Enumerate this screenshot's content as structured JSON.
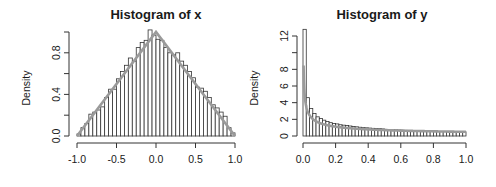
{
  "chart_data": [
    {
      "type": "bar",
      "title": "Histogram of x",
      "xlabel": "",
      "ylabel": "Density",
      "xlim": [
        -1.0,
        1.0
      ],
      "ylim": [
        0,
        1.0
      ],
      "x_ticks": [
        "-1.0",
        "-0.5",
        "0.0",
        "0.5",
        "1.0"
      ],
      "y_ticks": [
        "0.0",
        "0.4",
        "0.8"
      ],
      "y_minor_ticks": [
        0.0,
        0.2,
        0.4,
        0.6,
        0.8,
        1.0
      ],
      "bin_width": 0.05,
      "bin_start": -1.0,
      "values": [
        0.02,
        0.08,
        0.12,
        0.21,
        0.23,
        0.25,
        0.28,
        0.37,
        0.45,
        0.45,
        0.55,
        0.62,
        0.68,
        0.75,
        0.72,
        0.85,
        0.9,
        0.92,
        1.02,
        0.97,
        0.93,
        0.92,
        0.85,
        0.8,
        0.78,
        0.8,
        0.72,
        0.68,
        0.62,
        0.56,
        0.47,
        0.46,
        0.43,
        0.37,
        0.3,
        0.27,
        0.23,
        0.19,
        0.08,
        0.03
      ],
      "overlay": {
        "type": "line",
        "name": "density curve",
        "shape": "triangular",
        "points": [
          [
            -1.0,
            0.0
          ],
          [
            0.0,
            1.0
          ],
          [
            1.0,
            0.0
          ]
        ]
      },
      "grid": false,
      "legend": null
    },
    {
      "type": "bar",
      "title": "Histogram of y",
      "xlabel": "",
      "ylabel": "Density",
      "xlim": [
        0.0,
        1.0
      ],
      "ylim": [
        0,
        12
      ],
      "x_ticks": [
        "0.0",
        "0.2",
        "0.4",
        "0.6",
        "0.8",
        "1.0"
      ],
      "y_ticks": [
        "0",
        "2",
        "4",
        "6",
        "8",
        "12"
      ],
      "y_minor_ticks": [
        0,
        2,
        4,
        6,
        8,
        10,
        12
      ],
      "bin_width": 0.02,
      "bin_start": 0.0,
      "values": [
        12.8,
        4.6,
        3.3,
        2.7,
        2.3,
        2.1,
        1.9,
        1.75,
        1.6,
        1.5,
        1.45,
        1.35,
        1.3,
        1.25,
        1.2,
        1.15,
        1.1,
        1.05,
        1.0,
        0.98,
        0.95,
        0.92,
        0.9,
        0.88,
        0.85,
        0.8,
        0.78,
        0.76,
        0.74,
        0.72,
        0.7,
        0.68,
        0.66,
        0.64,
        0.62,
        0.6,
        0.59,
        0.58,
        0.57,
        0.56,
        0.55,
        0.54,
        0.53,
        0.52,
        0.52,
        0.51,
        0.51,
        0.5,
        0.5,
        0.5
      ],
      "overlay": {
        "type": "line",
        "name": "density curve",
        "shape": "1/(2*sqrt(y))"
      },
      "grid": false,
      "legend": null
    }
  ]
}
